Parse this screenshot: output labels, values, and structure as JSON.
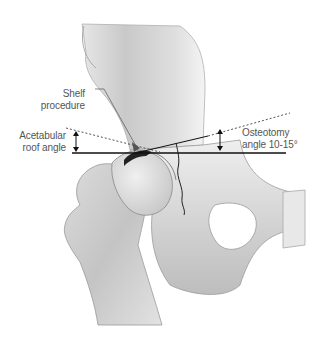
{
  "diagram": {
    "labels": {
      "shelf": [
        "Shelf",
        "procedure"
      ],
      "acetabular": [
        "Acetabular",
        "roof angle"
      ],
      "osteotomy": [
        "Osteotomy",
        "angle 10-15°"
      ]
    },
    "colors": {
      "bone_light": "#f2f2f2",
      "bone_mid": "#d4d4d4",
      "bone_dark": "#9c9c9c",
      "outline": "#7a7a7a",
      "line": "#111111",
      "dotted": "#555555",
      "text": "#555555"
    }
  }
}
